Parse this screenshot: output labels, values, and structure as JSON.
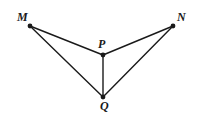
{
  "figure": {
    "background_color": "#ffffff",
    "stroke_color": "#1a1a1a",
    "vertex_color": "#1a1a1a",
    "stroke_width": 1.4,
    "vertex_radius": 2.4,
    "width": 200,
    "height": 119,
    "points": [
      {
        "id": "M",
        "label": "M",
        "x": 30,
        "y": 26
      },
      {
        "id": "N",
        "label": "N",
        "x": 173,
        "y": 26
      },
      {
        "id": "P",
        "label": "P",
        "x": 103,
        "y": 55
      },
      {
        "id": "Q",
        "label": "Q",
        "x": 103,
        "y": 97
      }
    ],
    "segments": [
      {
        "id": "MP",
        "from": "M",
        "to": "P",
        "x1": 30,
        "y1": 26,
        "x2": 103,
        "y2": 55
      },
      {
        "id": "PN",
        "from": "P",
        "to": "N",
        "x1": 103,
        "y1": 55,
        "x2": 173,
        "y2": 26
      },
      {
        "id": "MQ",
        "from": "M",
        "to": "Q",
        "x1": 30,
        "y1": 26,
        "x2": 103,
        "y2": 97
      },
      {
        "id": "QN",
        "from": "Q",
        "to": "N",
        "x1": 103,
        "y1": 97,
        "x2": 173,
        "y2": 26
      },
      {
        "id": "PQ",
        "from": "P",
        "to": "Q",
        "x1": 103,
        "y1": 55,
        "x2": 103,
        "y2": 97
      }
    ],
    "labels": {
      "M": "M",
      "N": "N",
      "P": "P",
      "Q": "Q"
    }
  }
}
